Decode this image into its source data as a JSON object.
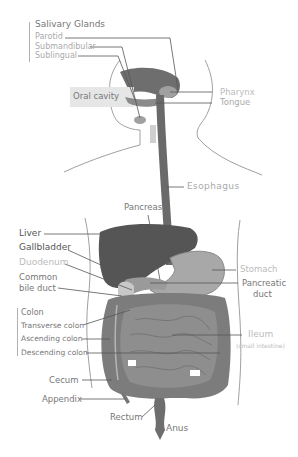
{
  "diagram": {
    "colors": {
      "organ_dark": "#5a5a5a",
      "organ_mid": "#808080",
      "organ_light": "#a8a8a8",
      "outline": "#9a9a9a",
      "leader_line": "#555555",
      "oral_cavity_box": "#e6e6e6"
    },
    "groups": {
      "salivary": {
        "heading": "Salivary Glands",
        "items": [
          "Parotid",
          "Submandibular",
          "Sublingual"
        ]
      },
      "colon": {
        "heading": "Colon",
        "items": [
          "Transverse colon",
          "Ascending colon",
          "Descending colon"
        ]
      }
    },
    "labels": {
      "oral_cavity": "Oral cavity",
      "pharynx": "Pharynx",
      "tongue": "Tongue",
      "esophagus": "Esophagus",
      "pancreas": "Pancreas",
      "liver": "Liver",
      "gallbladder": "Gallbladder",
      "duodenum": "Duodenum",
      "common_bile_duct_1": "Common",
      "common_bile_duct_2": "bile duct",
      "stomach": "Stomach",
      "pancreatic_duct_1": "Pancreatic",
      "pancreatic_duct_2": "duct",
      "ileum": "Ileum",
      "ileum_sub": "(small intestine)",
      "cecum": "Cecum",
      "appendix": "Appendix",
      "rectum": "Rectum",
      "anus": "Anus"
    }
  }
}
